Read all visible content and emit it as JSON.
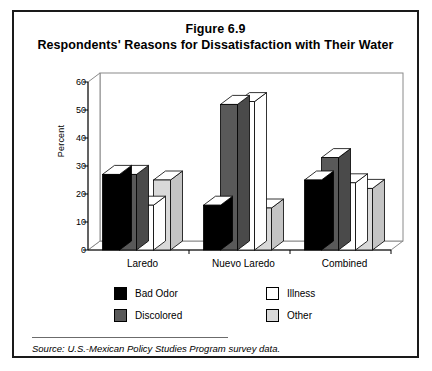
{
  "figure": {
    "title_line1": "Figure 6.9",
    "title_line2": "Respondents' Reasons for Dissatisfaction with Their Water",
    "source": "Source:  U.S.-Mexican Policy Studies Program survey data."
  },
  "legend": {
    "entries": [
      {
        "label": "Bad Odor",
        "color": "#000000",
        "name": "legend-swatch-bad-odor"
      },
      {
        "label": "Discolored",
        "color": "#595959",
        "name": "legend-swatch-discolored"
      },
      {
        "label": "Illness",
        "color": "#ffffff",
        "name": "legend-swatch-illness"
      },
      {
        "label": "Other",
        "color": "#d9d9d9",
        "name": "legend-swatch-other"
      }
    ]
  },
  "chart_data": {
    "type": "bar",
    "title": "Respondents' Reasons for Dissatisfaction with Their Water",
    "subtitle": "Figure 6.9",
    "xlabel": "",
    "ylabel": "Percent",
    "ylim": [
      0,
      60
    ],
    "yticks": [
      0,
      10,
      20,
      30,
      40,
      50,
      60
    ],
    "ytick_labels": [
      "0",
      "10",
      "20",
      "30",
      "40",
      "50",
      "60"
    ],
    "grid": false,
    "legend_position": "bottom",
    "three_d": true,
    "categories": [
      "Laredo",
      "Nuevo Laredo",
      "Combined"
    ],
    "series": [
      {
        "name": "Bad Odor",
        "color": "#000000",
        "values": [
          27,
          16,
          25
        ]
      },
      {
        "name": "Discolored",
        "color": "#595959",
        "values": [
          27,
          52,
          33
        ]
      },
      {
        "name": "Illness",
        "color": "#ffffff",
        "values": [
          16,
          53,
          24
        ]
      },
      {
        "name": "Other",
        "color": "#d9d9d9",
        "values": [
          25,
          15,
          22
        ]
      }
    ]
  }
}
